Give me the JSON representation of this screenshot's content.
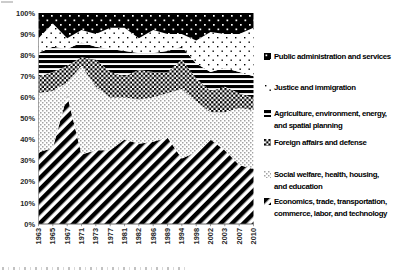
{
  "chart_data": {
    "type": "area",
    "stacked": "percent",
    "title": "",
    "x_labels": [
      "1963",
      "1965",
      "1967",
      "1971",
      "1973",
      "1977",
      "1981",
      "1982",
      "1986",
      "1989",
      "1994",
      "1998",
      "2002",
      "2003",
      "2007",
      "2010"
    ],
    "y_tick_labels": [
      "0%",
      "10%",
      "20%",
      "30%",
      "40%",
      "50%",
      "60%",
      "70%",
      "80%",
      "90%",
      "100%"
    ],
    "ylim": [
      0,
      100
    ],
    "grid": false,
    "series_bottom_to_top": [
      {
        "name": "Economics, trade, transportation, commerce, labor, and technology",
        "pattern": "diagonal-stripes-up",
        "values": [
          34,
          36,
          61,
          33,
          35,
          35,
          40,
          38,
          39,
          41,
          31,
          34,
          40,
          35,
          28,
          26
        ]
      },
      {
        "name": "Social welfare, health, housing, and education",
        "pattern": "fine-dots",
        "values": [
          28,
          27,
          6,
          42,
          30,
          25,
          20,
          21,
          21,
          21,
          33,
          24,
          13,
          18,
          27,
          28
        ]
      },
      {
        "name": "Foreign affairs and defense",
        "pattern": "checkerboard",
        "values": [
          8,
          9,
          8,
          4,
          13,
          12,
          10,
          14,
          12,
          10,
          14,
          11,
          10,
          12,
          7,
          6
        ]
      },
      {
        "name": "Agriculture, environment, energy, and spatial planning",
        "pattern": "horizontal-lines",
        "values": [
          11,
          12,
          8,
          7,
          6,
          11,
          12,
          8,
          9,
          10,
          6,
          7,
          9,
          9,
          10,
          10
        ]
      },
      {
        "name": "Justice and immigration",
        "pattern": "sparse-dots-on-white",
        "values": [
          7,
          11,
          5,
          6,
          6,
          10,
          11,
          7,
          11,
          8,
          6,
          11,
          19,
          16,
          18,
          23
        ]
      },
      {
        "name": "Public administration and services",
        "pattern": "white-dots-on-black",
        "values": [
          12,
          5,
          12,
          8,
          10,
          7,
          7,
          12,
          8,
          10,
          10,
          13,
          9,
          10,
          10,
          7
        ]
      }
    ],
    "legend": {
      "position": "right",
      "items_top_to_bottom": [
        {
          "label": "Public administration and services",
          "lines": [
            "Public administration and services"
          ],
          "pattern": "white-dots-on-black"
        },
        {
          "label": "Justice and immigration",
          "lines": [
            "Justice and immigration"
          ],
          "pattern": "sparse-dots-on-white"
        },
        {
          "label": "Agriculture, environment, energy, and spatial planning",
          "lines": [
            "Agriculture, environment, energy,",
            "and spatial planning"
          ],
          "pattern": "horizontal-lines"
        },
        {
          "label": "Foreign affairs and defense",
          "lines": [
            "Foreign affairs and defense"
          ],
          "pattern": "checkerboard"
        },
        {
          "label": "Social welfare, health, housing, and education",
          "lines": [
            "Social welfare, health, housing,",
            "and education"
          ],
          "pattern": "fine-dots"
        },
        {
          "label": "Economics, trade, transportation, commerce, labor, and technology",
          "lines": [
            "Economics, trade, transportation,",
            "commerce, labor, and technology"
          ],
          "pattern": "diagonal-stripes-up"
        }
      ]
    }
  },
  "colors": {
    "ink": "#000000",
    "background": "#ffffff",
    "axis_text": "#262626"
  }
}
